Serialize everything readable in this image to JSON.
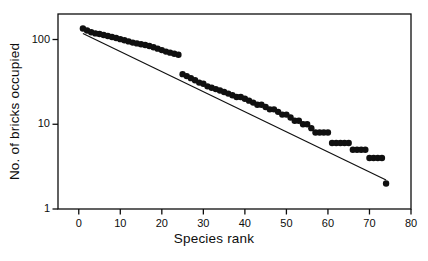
{
  "figure": {
    "background": "#ffffff",
    "ink": "#0d0d0d"
  },
  "chart_data": {
    "type": "scatter",
    "title": "",
    "subtitle": "",
    "xlabel": "Species rank",
    "ylabel": "No. of bricks occupied",
    "grid": false,
    "legend": null,
    "xscale": "linear",
    "yscale": "log",
    "xlim": [
      -5,
      80
    ],
    "ylim": [
      1,
      200
    ],
    "xticks": [
      0,
      10,
      20,
      30,
      40,
      50,
      60,
      70,
      80
    ],
    "xticklabels": [
      "0",
      "10",
      "20",
      "30",
      "40",
      "50",
      "60",
      "70",
      "80"
    ],
    "yticks": [
      1,
      10,
      100
    ],
    "yticklabels": [
      "1",
      "10",
      "100"
    ],
    "marker": {
      "shape": "filled-circle",
      "size": 4.2,
      "color": "#101010"
    },
    "series": [
      {
        "name": "bricks occupied per species",
        "x": [
          1,
          2,
          3,
          4,
          5,
          6,
          7,
          8,
          9,
          10,
          11,
          12,
          13,
          14,
          15,
          16,
          17,
          18,
          19,
          20,
          21,
          22,
          23,
          24,
          25,
          26,
          27,
          28,
          29,
          30,
          31,
          32,
          33,
          34,
          35,
          36,
          37,
          38,
          39,
          40,
          41,
          42,
          43,
          44,
          45,
          46,
          47,
          48,
          49,
          50,
          51,
          52,
          53,
          54,
          55,
          56,
          57,
          58,
          59,
          60,
          61,
          62,
          63,
          64,
          65,
          66,
          67,
          68,
          69,
          70,
          71,
          72,
          73,
          74
        ],
        "y": [
          135,
          128,
          122,
          118,
          116,
          113,
          110,
          107,
          104,
          101,
          98,
          95,
          92,
          90,
          88,
          86,
          84,
          81,
          78,
          75,
          72,
          70,
          68,
          66,
          39,
          37,
          35,
          33,
          31,
          30,
          28,
          27,
          26,
          25,
          24,
          23,
          22,
          21,
          21,
          20,
          19,
          18,
          17,
          17,
          16,
          15,
          15,
          14,
          13,
          13,
          12,
          11,
          11,
          10,
          10,
          9,
          8,
          8,
          8,
          8,
          6,
          6,
          6,
          6,
          6,
          5,
          5,
          5,
          5,
          4,
          4,
          4,
          4,
          2
        ]
      }
    ],
    "fit_line": {
      "name": "log-linear regression fit",
      "style": "solid",
      "color": "#101010",
      "x": [
        1,
        74
      ],
      "y": [
        118,
        2.2
      ]
    }
  }
}
